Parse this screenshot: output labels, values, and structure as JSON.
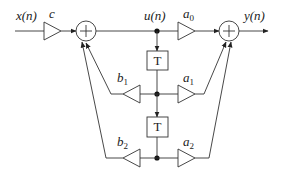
{
  "diagram": {
    "type": "signal-flow-graph",
    "signals": {
      "input": "x(n)",
      "intermediate": "u(n)",
      "output": "y(n)"
    },
    "gains": {
      "input_gain": "c",
      "a0": {
        "base": "a",
        "sub": "0"
      },
      "a1": {
        "base": "a",
        "sub": "1"
      },
      "a2": {
        "base": "a",
        "sub": "2"
      },
      "b1": {
        "base": "b",
        "sub": "1"
      },
      "b2": {
        "base": "b",
        "sub": "2"
      }
    },
    "delays": [
      "T",
      "T"
    ],
    "adders": [
      "+",
      "+"
    ]
  }
}
